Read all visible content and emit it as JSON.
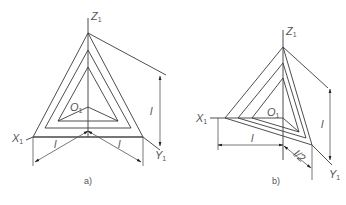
{
  "figure": {
    "type": "axonometric-axes-construction",
    "stroke_color": "#3a3a3a",
    "background": "#ffffff"
  },
  "panels": [
    {
      "id": "a",
      "caption": "a)",
      "axes": {
        "z_label": "Z",
        "z_sub": "1",
        "x_label": "X",
        "x_sub": "1",
        "y_label": "Y",
        "y_sub": "1",
        "origin_label": "O",
        "origin_sub": "1"
      },
      "dimensions": {
        "vertical": "l",
        "left": "l",
        "right": "l"
      }
    },
    {
      "id": "b",
      "caption": "b)",
      "axes": {
        "z_label": "Z",
        "z_sub": "1",
        "x_label": "X",
        "x_sub": "1",
        "y_label": "Y",
        "y_sub": "1",
        "origin_label": "O",
        "origin_sub": "1"
      },
      "dimensions": {
        "vertical": "l",
        "horizontal": "l",
        "diagonal": "l/2"
      }
    }
  ]
}
